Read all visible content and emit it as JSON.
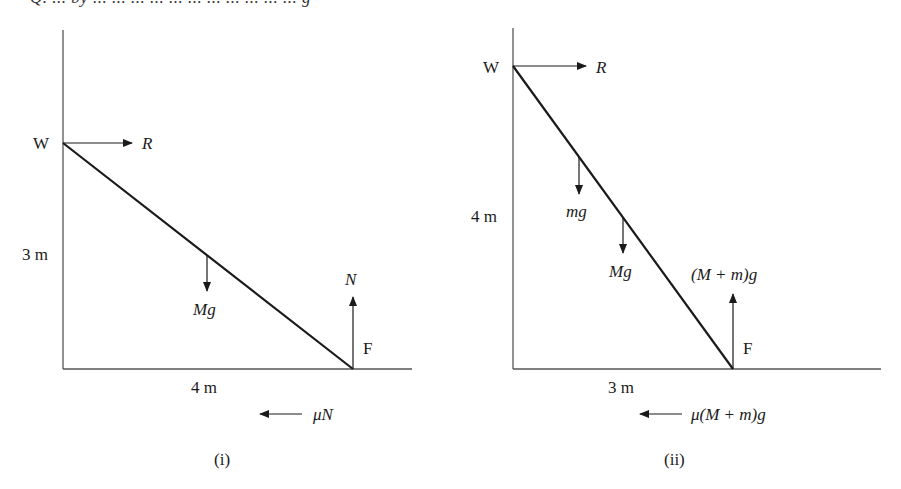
{
  "header_fragment": "Q. ... by ... ... ... ... ... ... ... ... ... ... ... g",
  "colors": {
    "line": "#1a1a1a",
    "axis": "#555555",
    "background": "#ffffff"
  },
  "diagram_i": {
    "caption": "(i)",
    "top_label": "W",
    "bottom_label": "F",
    "height_label": "3 m",
    "width_label": "4 m",
    "forces": {
      "reaction_wall": "R",
      "weight": "Mg",
      "normal": "N",
      "friction": "μN"
    }
  },
  "diagram_ii": {
    "caption": "(ii)",
    "top_label": "W",
    "bottom_label": "F",
    "height_label": "4 m",
    "width_label": "3 m",
    "forces": {
      "reaction_wall": "R",
      "man_weight": "mg",
      "weight": "Mg",
      "normal": "(M + m)g",
      "friction": "μ(M + m)g"
    }
  }
}
